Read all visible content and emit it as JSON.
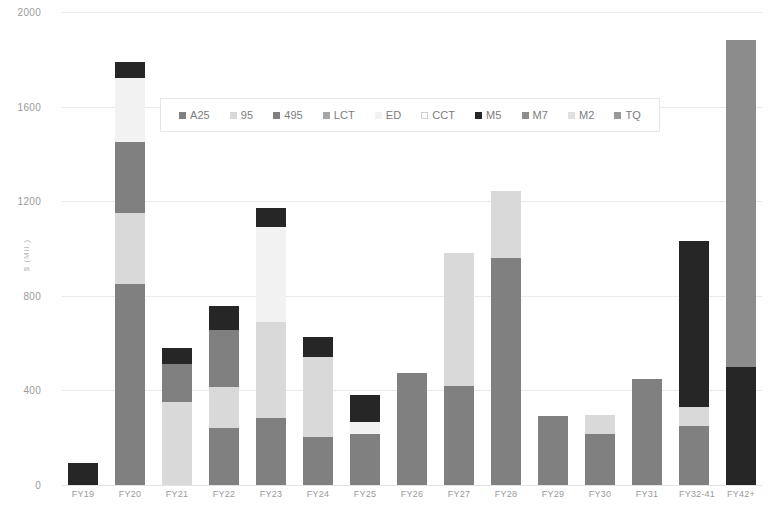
{
  "chart_data": {
    "type": "bar",
    "stacked": true,
    "title": "",
    "xlabel": "",
    "ylabel": "$ (Mil.)",
    "ylim": [
      0,
      2000
    ],
    "ytick_step": 400,
    "yticks": [
      "2000",
      "1600",
      "1200",
      "800",
      "400",
      "0"
    ],
    "grid": true,
    "legend_position": "top-center",
    "categories": [
      "FY19",
      "FY20",
      "FY21",
      "FY22",
      "FY23",
      "FY24",
      "FY25",
      "FY26",
      "FY27",
      "FY28",
      "FY29",
      "FY30",
      "FY31",
      "FY32-41",
      "FY42+"
    ],
    "series": [
      {
        "name": "A25",
        "color": "#808080",
        "values": [
          0,
          850,
          0,
          240,
          285,
          205,
          215,
          475,
          420,
          960,
          290,
          215,
          450,
          250,
          0
        ]
      },
      {
        "name": "95",
        "color": "#d9d9d9",
        "values": [
          0,
          300,
          350,
          175,
          405,
          335,
          0,
          0,
          560,
          285,
          0,
          80,
          0,
          80,
          0
        ]
      },
      {
        "name": "495",
        "color": "#808080",
        "values": [
          0,
          300,
          160,
          240,
          0,
          0,
          0,
          0,
          0,
          0,
          0,
          0,
          0,
          0,
          0
        ]
      },
      {
        "name": "LCT",
        "color": "#a6a6a6",
        "values": [
          0,
          0,
          0,
          0,
          0,
          0,
          0,
          0,
          0,
          0,
          0,
          0,
          0,
          0,
          0
        ]
      },
      {
        "name": "ED",
        "color": "#f2f2f2",
        "values": [
          0,
          270,
          0,
          0,
          400,
          0,
          50,
          0,
          0,
          0,
          0,
          0,
          0,
          0,
          0
        ]
      },
      {
        "name": "CCT",
        "color": "#ffffff",
        "values": [
          0,
          0,
          0,
          0,
          0,
          0,
          0,
          0,
          0,
          0,
          0,
          0,
          0,
          0,
          0
        ]
      },
      {
        "name": "M5",
        "color": "#262626",
        "values": [
          95,
          70,
          70,
          100,
          80,
          85,
          115,
          0,
          0,
          0,
          0,
          0,
          0,
          700,
          500
        ]
      },
      {
        "name": "M7",
        "color": "#8c8c8c",
        "values": [
          0,
          0,
          0,
          0,
          0,
          0,
          0,
          0,
          0,
          0,
          0,
          0,
          0,
          0,
          1380
        ]
      },
      {
        "name": "M2",
        "color": "#e0e0e0",
        "values": [
          0,
          0,
          0,
          0,
          0,
          0,
          0,
          0,
          0,
          0,
          0,
          0,
          0,
          0,
          0
        ]
      },
      {
        "name": "TQ",
        "color": "#999999",
        "values": [
          0,
          0,
          0,
          0,
          0,
          0,
          0,
          0,
          0,
          0,
          0,
          0,
          0,
          0,
          0
        ]
      }
    ],
    "totals": [
      95,
      1790,
      580,
      755,
      1170,
      625,
      380,
      475,
      980,
      1245,
      290,
      295,
      450,
      1030,
      1880
    ]
  },
  "legend": {
    "items": [
      {
        "label": "A25"
      },
      {
        "label": "95"
      },
      {
        "label": "495"
      },
      {
        "label": "LCT"
      },
      {
        "label": "ED"
      },
      {
        "label": "CCT"
      },
      {
        "label": "M5"
      },
      {
        "label": "M7"
      },
      {
        "label": "M2"
      },
      {
        "label": "TQ"
      }
    ]
  }
}
